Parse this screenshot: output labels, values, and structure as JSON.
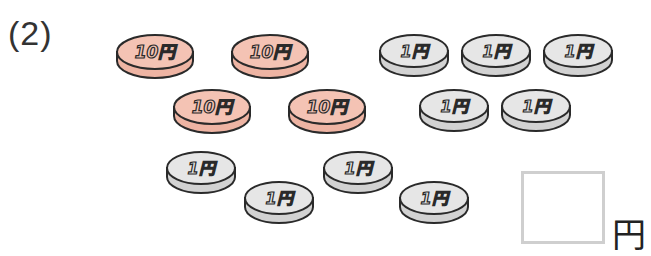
{
  "question": {
    "number_label": "(2)"
  },
  "colors": {
    "ten_yen_face": "#f4c3b4",
    "ten_yen_edge": "#eeb4a3",
    "one_yen_face": "#e6e6e6",
    "one_yen_edge": "#d2d2d2",
    "outline": "#2a2a2a",
    "answer_box_border": "#cfcfcf"
  },
  "coins": [
    {
      "type": "ten_yen",
      "label": "10円",
      "x": 115,
      "y": 33,
      "w": 80,
      "h": 48
    },
    {
      "type": "ten_yen",
      "label": "10円",
      "x": 230,
      "y": 33,
      "w": 80,
      "h": 48
    },
    {
      "type": "ten_yen",
      "label": "10円",
      "x": 172,
      "y": 88,
      "w": 80,
      "h": 48
    },
    {
      "type": "ten_yen",
      "label": "10円",
      "x": 287,
      "y": 88,
      "w": 80,
      "h": 48
    },
    {
      "type": "one_yen",
      "label": "1円",
      "x": 378,
      "y": 33,
      "w": 72,
      "h": 46
    },
    {
      "type": "one_yen",
      "label": "1円",
      "x": 460,
      "y": 33,
      "w": 72,
      "h": 46
    },
    {
      "type": "one_yen",
      "label": "1円",
      "x": 542,
      "y": 33,
      "w": 72,
      "h": 46
    },
    {
      "type": "one_yen",
      "label": "1円",
      "x": 418,
      "y": 88,
      "w": 72,
      "h": 46
    },
    {
      "type": "one_yen",
      "label": "1円",
      "x": 500,
      "y": 88,
      "w": 72,
      "h": 46
    },
    {
      "type": "one_yen",
      "label": "1円",
      "x": 165,
      "y": 150,
      "w": 72,
      "h": 46
    },
    {
      "type": "one_yen",
      "label": "1円",
      "x": 243,
      "y": 180,
      "w": 72,
      "h": 46
    },
    {
      "type": "one_yen",
      "label": "1円",
      "x": 322,
      "y": 150,
      "w": 72,
      "h": 46
    },
    {
      "type": "one_yen",
      "label": "1円",
      "x": 398,
      "y": 180,
      "w": 72,
      "h": 46
    }
  ],
  "answer": {
    "value": "",
    "unit": "円"
  }
}
